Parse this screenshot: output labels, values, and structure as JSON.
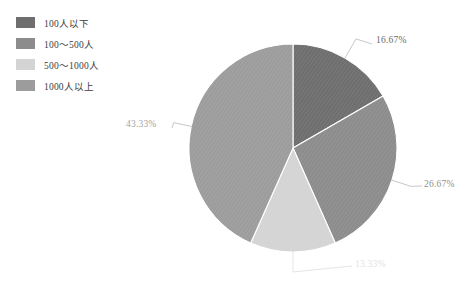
{
  "legend": {
    "items": [
      {
        "label": "100人以下",
        "color": "#6e6e6e",
        "swatch_name": "legend-swatch-100-or-less"
      },
      {
        "label": "100～500人",
        "color": "#8c8c8c",
        "swatch_name": "legend-swatch-100-500"
      },
      {
        "label": "500～1000人",
        "color": "#d4d4d4",
        "swatch_name": "legend-swatch-500-1000"
      },
      {
        "label": "1000人以上",
        "color": "#9c9c9c",
        "swatch_name": "legend-swatch-1000-or-more"
      }
    ]
  },
  "chart_data": {
    "type": "pie",
    "title": "",
    "categories": [
      "100人以下",
      "100～500人",
      "500～1000人",
      "1000人以上"
    ],
    "values": [
      16.67,
      26.67,
      13.33,
      43.33
    ],
    "value_labels": [
      "16.67%",
      "26.67%",
      "13.33%",
      "43.33%"
    ],
    "colors": [
      "#6e6e6e",
      "#8c8c8c",
      "#d4d4d4",
      "#9c9c9c"
    ],
    "units": "percent",
    "total": 100,
    "start_angle_deg": 0,
    "direction": "clockwise",
    "legend_position": "top-left",
    "grid": false,
    "label_style": "outside-with-leader-line",
    "leader_line_color": "#b5b5b5",
    "slice_border_color": "#ffffff",
    "background": "#ffffff"
  },
  "geometry": {
    "center_x": 293,
    "center_y": 148,
    "radius": 104
  }
}
